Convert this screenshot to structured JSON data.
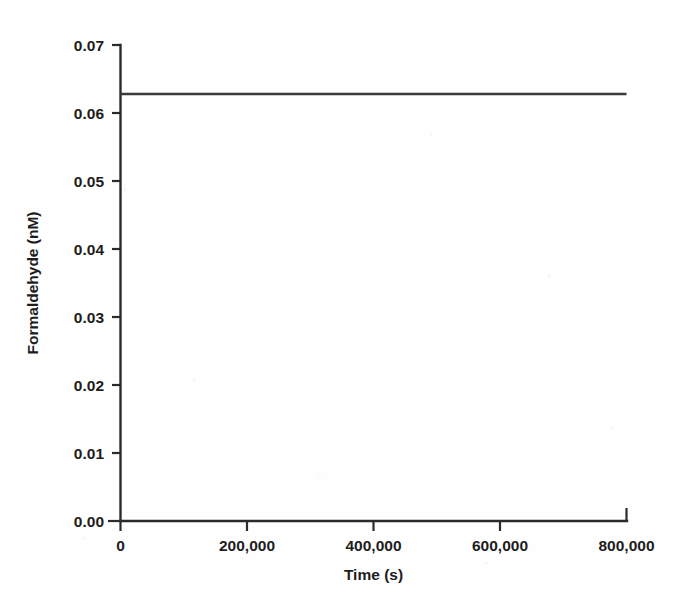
{
  "chart_data": {
    "type": "line",
    "title": "",
    "xlabel": "Time (s)",
    "ylabel": "Formaldehyde (nM)",
    "xlim": [
      0,
      800000
    ],
    "ylim": [
      0,
      0.07
    ],
    "grid": false,
    "legend": null,
    "x_ticks": [
      0,
      200000,
      400000,
      600000,
      800000
    ],
    "x_tick_labels": [
      "0",
      "200,000",
      "400,000",
      "600,000",
      "800,000"
    ],
    "y_ticks": [
      0.0,
      0.01,
      0.02,
      0.03,
      0.04,
      0.05,
      0.06,
      0.07
    ],
    "y_tick_labels": [
      "0.00",
      "0.01",
      "0.02",
      "0.03",
      "0.04",
      "0.05",
      "0.06",
      "0.07"
    ],
    "series": [
      {
        "name": "Formaldehyde",
        "color": "#3a3a3a",
        "x": [
          0,
          100000,
          200000,
          300000,
          400000,
          500000,
          600000,
          700000,
          800000
        ],
        "values": [
          0.0628,
          0.0628,
          0.0628,
          0.0628,
          0.0628,
          0.0628,
          0.0628,
          0.0628,
          0.0628
        ]
      }
    ]
  },
  "axis": {
    "x_title": "Time (s)",
    "y_title": "Formaldehyde (nM)"
  },
  "ticks": {
    "y": [
      "0.07",
      "0.06",
      "0.05",
      "0.04",
      "0.03",
      "0.02",
      "0.01",
      "0.00"
    ],
    "x": [
      "0",
      "200,000",
      "400,000",
      "600,000",
      "800,000"
    ]
  },
  "colors": {
    "line": "#3a3a3a",
    "axis": "#2b2b2b",
    "text": "#1d1d1d",
    "background": "#fefefe"
  }
}
